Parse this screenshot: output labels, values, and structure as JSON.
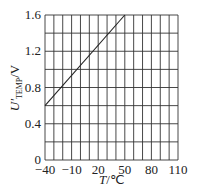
{
  "chart_data": {
    "type": "line",
    "title": "",
    "xlabel": "T/℃",
    "ylabel": "U'TEMP/V",
    "ylabel_parts": {
      "symbol": "U",
      "prime": "'",
      "subscript": "TEMP",
      "unit": "/V"
    },
    "xlabel_parts": {
      "symbol": "T",
      "unit": "/℃"
    },
    "xlim": [
      -40,
      110
    ],
    "ylim": [
      0,
      1.6
    ],
    "x_ticks": [
      -40,
      -10,
      20,
      50,
      80,
      110
    ],
    "x_tick_labels": [
      "−40",
      "−10",
      "20",
      "50",
      "80",
      "110"
    ],
    "y_ticks": [
      0,
      0.4,
      0.8,
      1.2,
      1.6
    ],
    "y_tick_labels": [
      "0",
      "0.4",
      "0.8",
      "1.2",
      "1.6"
    ],
    "x_grid_step": 10,
    "y_grid_step": 0.2,
    "grid": true,
    "legend": null,
    "series": [
      {
        "name": "U'TEMP",
        "x": [
          -40,
          50
        ],
        "y": [
          0.6,
          1.6
        ],
        "color": "#222222"
      }
    ]
  }
}
